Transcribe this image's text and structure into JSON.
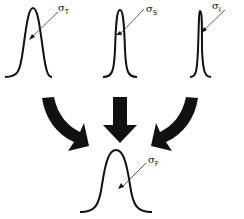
{
  "diagram": {
    "curves": [
      {
        "id": "T",
        "symbol": "σ",
        "subscript": "T",
        "width": "wide"
      },
      {
        "id": "S",
        "symbol": "σ",
        "subscript": "S",
        "width": "narrow"
      },
      {
        "id": "I",
        "symbol": "σ",
        "subscript": "I",
        "width": "very-narrow"
      },
      {
        "id": "F",
        "symbol": "σ",
        "subscript": "F",
        "width": "wide",
        "role": "result"
      }
    ],
    "arrows": [
      "left-curved",
      "center-straight",
      "right-curved"
    ],
    "colors": {
      "ink": "#111111",
      "background": "#ffffff"
    }
  }
}
